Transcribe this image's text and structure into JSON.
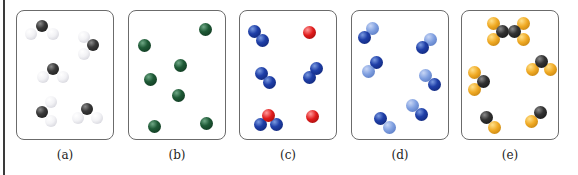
{
  "figure": {
    "panels": [
      {
        "id": "a",
        "label": "(a)",
        "description": "Five triatomic molecules, each one dark gray atom bonded to two white atoms"
      },
      {
        "id": "b",
        "label": "(b)",
        "description": "Seven separate dark green single atoms"
      },
      {
        "id": "c",
        "label": "(c)",
        "description": "Mixture: three blue diatomic molecules, one red-blue-blue triatomic molecule, two single red atoms"
      },
      {
        "id": "d",
        "label": "(d)",
        "description": "Six diatomic molecules each made of one dark blue and one light blue atom"
      },
      {
        "id": "e",
        "label": "(e)",
        "description": "Mixture: one C2-with-four-yellow molecule, one black with two yellow, one black with two yellow, two black-yellow diatomics"
      }
    ],
    "colors": {
      "dark_gray_atom": "#2e2e2e",
      "white_atom": "#f0f0f4",
      "green_atom": "#1e5a36",
      "blue_atom": "#1f3fa8",
      "light_blue_atom": "#7f9fe0",
      "red_atom": "#e01b1b",
      "yellow_atom": "#f0aa24",
      "panel_border": "#6b6b6b"
    }
  }
}
